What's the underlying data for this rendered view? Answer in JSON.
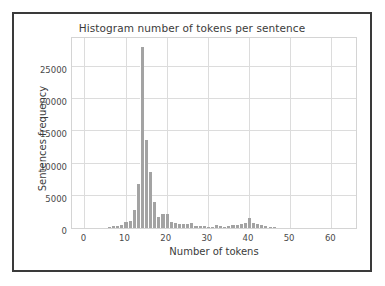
{
  "figure": {
    "title": "Histogram number of tokens per sentence",
    "background_color": "#ffffff",
    "frame_color": "#3a3a3a",
    "bar_color": "#a3a3a3",
    "grid_color": "#dcdcdc"
  },
  "chart_data": {
    "type": "bar",
    "title": "Histogram number of tokens per sentence",
    "xlabel": "Number of tokens",
    "ylabel": "Sentences frequency",
    "xlim": [
      -3,
      66
    ],
    "ylim": [
      0,
      29500
    ],
    "xticks": [
      0,
      10,
      20,
      30,
      40,
      50,
      60
    ],
    "xtick_labels": [
      "0",
      "10",
      "20",
      "30",
      "40",
      "50",
      "60"
    ],
    "yticks": [
      0,
      5000,
      10000,
      15000,
      20000,
      25000
    ],
    "ytick_labels": [
      "0",
      "5000",
      "10000",
      "15000",
      "20000",
      "25000"
    ],
    "grid": true,
    "legend": "none",
    "bin_width": 1,
    "categories": [
      6,
      7,
      8,
      9,
      10,
      11,
      12,
      13,
      14,
      15,
      16,
      17,
      18,
      19,
      20,
      21,
      22,
      23,
      24,
      25,
      26,
      27,
      28,
      29,
      30,
      31,
      32,
      33,
      34,
      35,
      36,
      37,
      38,
      39,
      40,
      41,
      42,
      43,
      44,
      45,
      46
    ],
    "values": [
      200,
      260,
      320,
      420,
      900,
      1050,
      2750,
      6800,
      28100,
      13650,
      8700,
      4100,
      1750,
      2200,
      2250,
      900,
      750,
      700,
      600,
      600,
      750,
      350,
      300,
      250,
      220,
      200,
      400,
      250,
      220,
      300,
      420,
      480,
      600,
      750,
      1500,
      800,
      650,
      420,
      300,
      220,
      150
    ]
  }
}
